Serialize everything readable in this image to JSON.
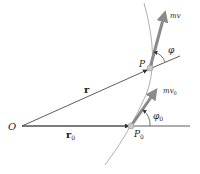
{
  "diagram": {
    "labels": {
      "origin": "O",
      "r": "r",
      "r0_main": "r",
      "r0_sub": "0",
      "P": "P",
      "P0_main": "P",
      "P0_sub": "0",
      "mv": "mv",
      "mv0_main": "mv",
      "mv0_sub": "0",
      "phi": "φ",
      "phi0_main": "φ",
      "phi0_sub": "0"
    },
    "colors": {
      "line": "#333333",
      "arrow": "#8a8a8a",
      "curve": "#9a9a9a",
      "dot": "#c8c8c8"
    }
  }
}
